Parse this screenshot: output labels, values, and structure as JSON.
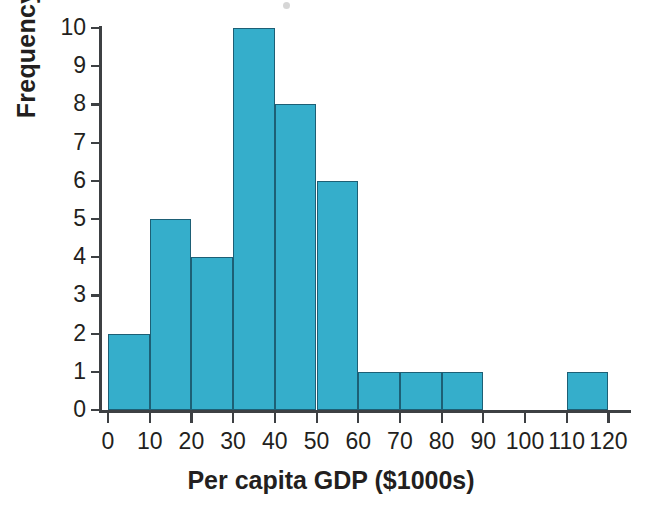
{
  "chart_data": {
    "type": "bar",
    "chart_subtype": "histogram",
    "title": "",
    "xlabel": "Per capita GDP ($1000s)",
    "ylabel": "Frequency",
    "xlim": [
      0,
      125
    ],
    "ylim": [
      0,
      10
    ],
    "grid": false,
    "legend": null,
    "bin_width": 10,
    "bin_edges": [
      0,
      10,
      20,
      30,
      40,
      50,
      60,
      70,
      80,
      90,
      100,
      110,
      120
    ],
    "categories": [
      "0-10",
      "10-20",
      "20-30",
      "30-40",
      "40-50",
      "50-60",
      "60-70",
      "70-80",
      "80-90",
      "90-100",
      "100-110",
      "110-120"
    ],
    "values": [
      2,
      5,
      4,
      10,
      8,
      6,
      1,
      1,
      1,
      0,
      0,
      1
    ],
    "bars": [
      {
        "bin_start": 0,
        "bin_end": 10,
        "value": 2
      },
      {
        "bin_start": 10,
        "bin_end": 20,
        "value": 5
      },
      {
        "bin_start": 20,
        "bin_end": 30,
        "value": 4
      },
      {
        "bin_start": 30,
        "bin_end": 40,
        "value": 10
      },
      {
        "bin_start": 40,
        "bin_end": 50,
        "value": 8
      },
      {
        "bin_start": 50,
        "bin_end": 60,
        "value": 6
      },
      {
        "bin_start": 60,
        "bin_end": 70,
        "value": 1
      },
      {
        "bin_start": 70,
        "bin_end": 80,
        "value": 1
      },
      {
        "bin_start": 80,
        "bin_end": 90,
        "value": 1
      },
      {
        "bin_start": 90,
        "bin_end": 100,
        "value": 0
      },
      {
        "bin_start": 100,
        "bin_end": 110,
        "value": 0
      },
      {
        "bin_start": 110,
        "bin_end": 120,
        "value": 1
      }
    ],
    "xticks": [
      0,
      10,
      20,
      30,
      40,
      50,
      60,
      70,
      80,
      90,
      100,
      110,
      120
    ],
    "xtick_labels": [
      "0",
      "10",
      "20",
      "30",
      "40",
      "50",
      "60",
      "70",
      "80",
      "90",
      "100",
      "110",
      "120"
    ],
    "yticks": [
      0,
      1,
      2,
      3,
      4,
      5,
      6,
      7,
      8,
      9,
      10
    ],
    "ytick_labels": [
      "0",
      "1",
      "2",
      "3",
      "4",
      "5",
      "6",
      "7",
      "8",
      "9",
      "10"
    ],
    "total_count": 39
  },
  "style": {
    "bar_fill": "#35aecb",
    "bar_edge": "#1d5f75",
    "axis_color": "#3d4043",
    "text_color": "#231f20",
    "background": "#ffffff"
  }
}
